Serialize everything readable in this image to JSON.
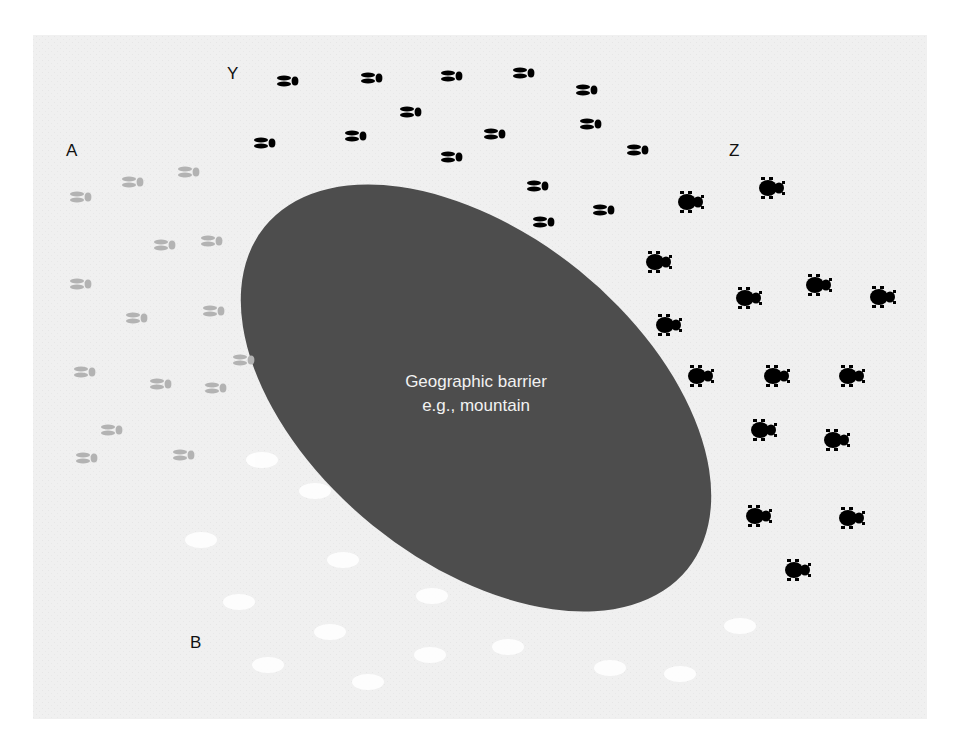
{
  "diagram": {
    "background_color": "#f0f0f0",
    "barrier": {
      "line1": "Geographic barrier",
      "line2": "e.g., mountain",
      "color": "#4d4d4d",
      "text_color": "#f2f2f2"
    },
    "labels": {
      "A": "A",
      "B": "B",
      "Y": "Y",
      "Z": "Z"
    },
    "populations": {
      "Y": {
        "description": "black striped insects",
        "color": "#000000",
        "count": 15
      },
      "A": {
        "description": "gray striped insects",
        "color": "#b3b3b3",
        "count": 15
      },
      "Z": {
        "description": "black beetles",
        "color": "#000000",
        "count": 15
      },
      "B": {
        "description": "white faint blobs",
        "color": "#ffffff",
        "count": 14
      }
    }
  }
}
